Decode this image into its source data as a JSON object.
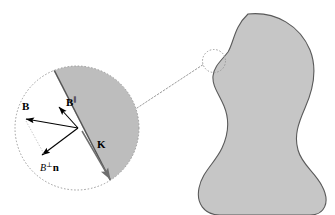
{
  "figure": {
    "background_color": "#ffffff"
  },
  "colors": {
    "body_fill": "#c6c6c6",
    "body_stroke": "#5a5a5a",
    "magnified_fill": "#bdbdbd",
    "magnified_stroke": "#8a8a8a",
    "interface_line": "#555555",
    "callout_dotted": "#9a9a9a",
    "arrow_black": "#000000",
    "arrow_gray": "#6e6e6e",
    "label_text": "#000000"
  },
  "main_body": {
    "name": "conducting-body",
    "shape_description": "peanut / dumbbell shaped region",
    "fill": "#c6c6c6",
    "stroke": "#5a5a5a"
  },
  "callout": {
    "name": "magnifier-callout",
    "source_circle": {
      "cx": 214,
      "cy": 61,
      "r": 11.5,
      "style": "dotted"
    },
    "magnified_circle": {
      "cx": 77,
      "cy": 128,
      "r": 62,
      "style": "dotted"
    },
    "connector_style": "dotted"
  },
  "magnified_view": {
    "name": "magnified-surface-region",
    "interior_label": "conductor interior (shaded)",
    "exterior_label": "vacuum (white)",
    "interface_label": "surface interface"
  },
  "vectors": [
    {
      "id": "B",
      "name": "vector-B",
      "label": "B",
      "label_style": "bold",
      "superscript": "",
      "color": "#000000",
      "description": "total magnetic field vector, points up-left",
      "x1": 78,
      "y1": 128,
      "x2": 24,
      "y2": 119
    },
    {
      "id": "B-parallel",
      "name": "vector-B-parallel",
      "label": "B",
      "label_style": "bold",
      "superscript": "∥",
      "color": "#000000",
      "description": "component of B parallel to the surface, points up along interface",
      "x1": 78,
      "y1": 128,
      "x2": 57,
      "y2": 105
    },
    {
      "id": "B-perp-n",
      "name": "vector-B-perp-n",
      "label": "B",
      "label_style": "italic",
      "superscript": "⊥",
      "suffix": "n",
      "suffix_style": "bold",
      "color": "#000000",
      "description": "normal component of B times unit normal n, points down-left",
      "x1": 78,
      "y1": 128,
      "x2": 40,
      "y2": 157
    },
    {
      "id": "K",
      "name": "vector-K",
      "label": "K",
      "label_style": "bold",
      "superscript": "",
      "color": "#6e6e6e",
      "description": "surface current density, points down-right along the interface",
      "x1": 82,
      "y1": 131,
      "x2": 112,
      "y2": 182
    }
  ],
  "labels": {
    "B": "B",
    "B_parallel_base": "B",
    "B_parallel_sup": "∥",
    "B_perp_base": "B",
    "B_perp_sup": "⊥",
    "B_perp_suffix": "n",
    "K": "K"
  }
}
